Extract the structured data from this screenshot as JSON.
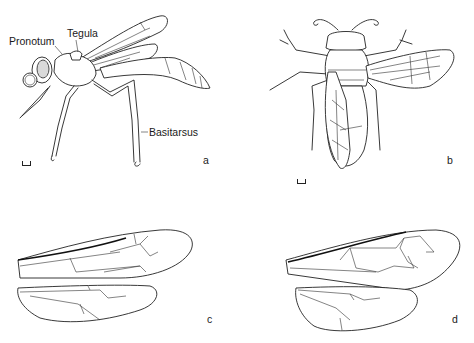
{
  "figure": {
    "panels": [
      {
        "id": "a",
        "letter": "a",
        "subject": "wasp lateral view",
        "labels": {
          "pronotum": "Pronotum",
          "tegula": "Tegula",
          "basitarsus": "Basitarsus"
        }
      },
      {
        "id": "b",
        "letter": "b",
        "subject": "wasp dorsal view"
      },
      {
        "id": "c",
        "letter": "c",
        "subject": "fore and hind wings"
      },
      {
        "id": "d",
        "letter": "d",
        "subject": "fore and hind wings"
      }
    ],
    "colors": {
      "line": "#222222",
      "background": "#ffffff",
      "eye_shade": "#d9d9d9"
    }
  }
}
